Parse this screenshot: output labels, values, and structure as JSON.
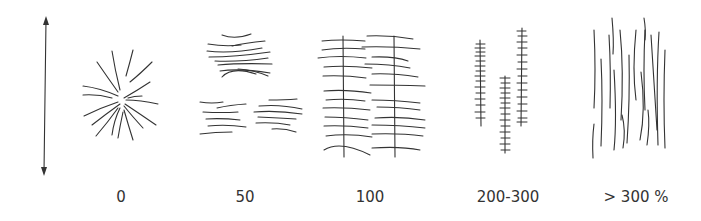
{
  "diagram": {
    "type": "fiber-orientation-vs-strain",
    "axis": {
      "icon": "double-arrow-vertical-icon",
      "direction": "vertical (draw direction)"
    },
    "panels": [
      {
        "label": "0",
        "description": "random radial fiber arrangement (spherulite)"
      },
      {
        "label": "50",
        "description": "three bundles of horizontally aligned fibers"
      },
      {
        "label": "100",
        "description": "horizontal fibers threaded by two vertical lines"
      },
      {
        "label": "200-300",
        "description": "three vertical shish-kebab structures"
      },
      {
        "label": "> 300 %",
        "description": "fully vertically aligned fibers"
      }
    ],
    "colors": {
      "ink": "#333333",
      "background": "#ffffff"
    }
  }
}
